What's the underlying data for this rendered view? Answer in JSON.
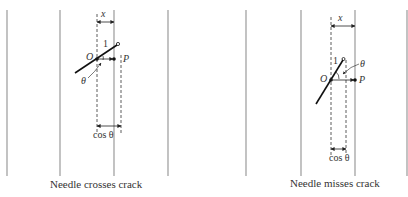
{
  "left_panel": {
    "caption": "Needle crosses crack",
    "labels": {
      "x": "x",
      "one": "1",
      "O": "O",
      "P": "P",
      "theta": "θ",
      "cos": "cos θ"
    }
  },
  "right_panel": {
    "caption": "Needle misses crack",
    "labels": {
      "x": "x",
      "one": "1",
      "O": "O",
      "P": "P",
      "theta": "θ",
      "cos": "cos θ"
    }
  },
  "colors": {
    "crack_line": "#9a9a9a",
    "ink": "#222222"
  }
}
